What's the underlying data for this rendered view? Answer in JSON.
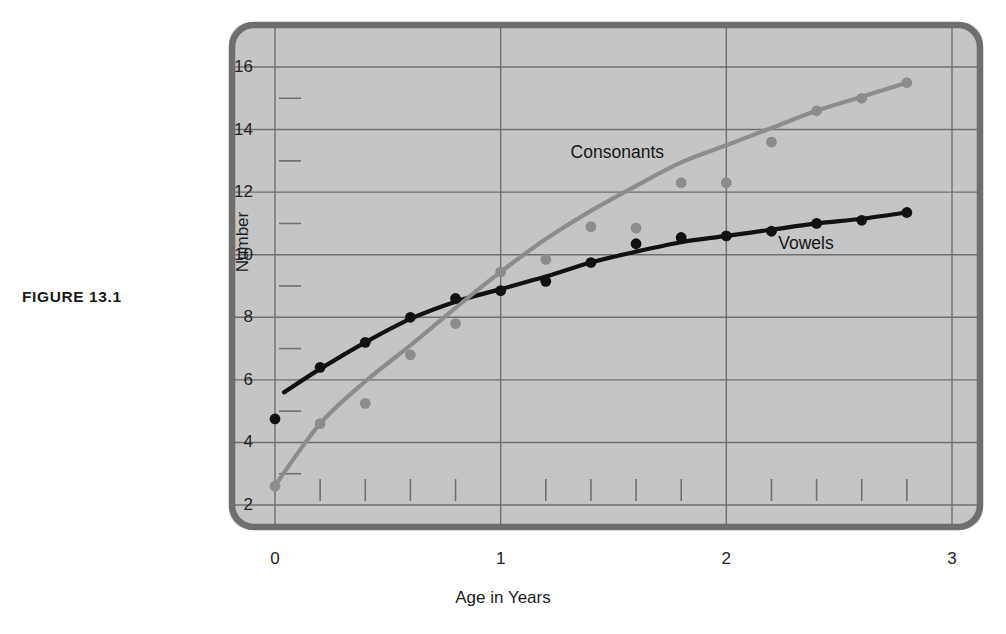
{
  "figure": {
    "caption": "FIGURE  13.1"
  },
  "chart_data": {
    "type": "scatter",
    "title": "",
    "xlabel": "Age in Years",
    "ylabel": "Number",
    "xlim": [
      0,
      3
    ],
    "ylim": [
      2,
      16.8
    ],
    "grid": true,
    "legend_position": "inline-annotation",
    "x_ticks_major": [
      0,
      1,
      2,
      3
    ],
    "x_tick_labels": [
      "0",
      "1",
      "2",
      "3"
    ],
    "x_ticks_minor": [
      0.2,
      0.4,
      0.6,
      0.8,
      1.2,
      1.4,
      1.6,
      1.8,
      2.2,
      2.4,
      2.6,
      2.8
    ],
    "y_ticks_major": [
      2,
      4,
      6,
      8,
      10,
      12,
      14,
      16
    ],
    "y_tick_labels": [
      "2",
      "4",
      "6",
      "8",
      "10",
      "12",
      "14",
      "16"
    ],
    "y_ticks_minor": [
      3,
      5,
      7,
      9,
      11,
      13,
      15
    ],
    "series": [
      {
        "name": "Vowels",
        "color": "#111111",
        "label_x": 2.23,
        "label_y": 10.35,
        "points": [
          {
            "x": 0.0,
            "y": 4.75
          },
          {
            "x": 0.2,
            "y": 6.4
          },
          {
            "x": 0.4,
            "y": 7.2
          },
          {
            "x": 0.6,
            "y": 8.0
          },
          {
            "x": 0.8,
            "y": 8.6
          },
          {
            "x": 1.0,
            "y": 8.85
          },
          {
            "x": 1.2,
            "y": 9.15
          },
          {
            "x": 1.4,
            "y": 9.75
          },
          {
            "x": 1.6,
            "y": 10.35
          },
          {
            "x": 1.8,
            "y": 10.55
          },
          {
            "x": 2.0,
            "y": 10.6
          },
          {
            "x": 2.2,
            "y": 10.75
          },
          {
            "x": 2.4,
            "y": 11.0
          },
          {
            "x": 2.6,
            "y": 11.1
          },
          {
            "x": 2.8,
            "y": 11.35
          }
        ],
        "curve": [
          {
            "x": 0.04,
            "y": 5.6
          },
          {
            "x": 0.2,
            "y": 6.35
          },
          {
            "x": 0.4,
            "y": 7.2
          },
          {
            "x": 0.6,
            "y": 7.95
          },
          {
            "x": 0.8,
            "y": 8.5
          },
          {
            "x": 1.0,
            "y": 8.9
          },
          {
            "x": 1.2,
            "y": 9.3
          },
          {
            "x": 1.4,
            "y": 9.75
          },
          {
            "x": 1.6,
            "y": 10.1
          },
          {
            "x": 1.8,
            "y": 10.4
          },
          {
            "x": 2.0,
            "y": 10.6
          },
          {
            "x": 2.2,
            "y": 10.8
          },
          {
            "x": 2.4,
            "y": 11.0
          },
          {
            "x": 2.6,
            "y": 11.15
          },
          {
            "x": 2.8,
            "y": 11.35
          }
        ]
      },
      {
        "name": "Consonants",
        "color": "#8c8c8c",
        "label_x": 1.31,
        "label_y": 13.25,
        "points": [
          {
            "x": 0.0,
            "y": 2.6
          },
          {
            "x": 0.2,
            "y": 4.6
          },
          {
            "x": 0.4,
            "y": 5.25
          },
          {
            "x": 0.6,
            "y": 6.8
          },
          {
            "x": 0.8,
            "y": 7.8
          },
          {
            "x": 1.0,
            "y": 9.45
          },
          {
            "x": 1.2,
            "y": 9.85
          },
          {
            "x": 1.4,
            "y": 10.9
          },
          {
            "x": 1.6,
            "y": 10.85
          },
          {
            "x": 1.8,
            "y": 12.3
          },
          {
            "x": 2.0,
            "y": 12.3
          },
          {
            "x": 2.2,
            "y": 13.6
          },
          {
            "x": 2.4,
            "y": 14.6
          },
          {
            "x": 2.6,
            "y": 15.0
          },
          {
            "x": 2.8,
            "y": 15.5
          }
        ],
        "curve": [
          {
            "x": 0.0,
            "y": 2.62
          },
          {
            "x": 0.2,
            "y": 4.6
          },
          {
            "x": 0.4,
            "y": 5.95
          },
          {
            "x": 0.6,
            "y": 7.1
          },
          {
            "x": 0.8,
            "y": 8.3
          },
          {
            "x": 1.0,
            "y": 9.45
          },
          {
            "x": 1.2,
            "y": 10.5
          },
          {
            "x": 1.4,
            "y": 11.4
          },
          {
            "x": 1.6,
            "y": 12.2
          },
          {
            "x": 1.8,
            "y": 12.95
          },
          {
            "x": 2.0,
            "y": 13.5
          },
          {
            "x": 2.2,
            "y": 14.05
          },
          {
            "x": 2.4,
            "y": 14.6
          },
          {
            "x": 2.6,
            "y": 15.05
          },
          {
            "x": 2.8,
            "y": 15.5
          }
        ]
      }
    ]
  },
  "colors": {
    "panel_fill": "#c5c5c5",
    "panel_border": "#6e6e6e",
    "gridline": "#6f6f6f",
    "vowels": "#111111",
    "consonants": "#8c8c8c",
    "text": "#1d1d1d"
  }
}
